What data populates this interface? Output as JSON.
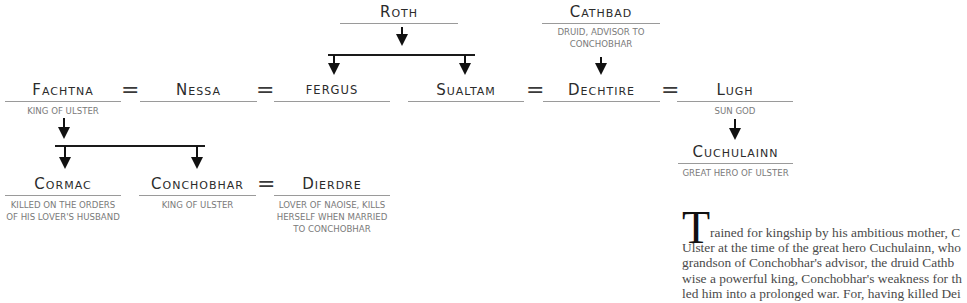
{
  "family_tree": {
    "roth": {
      "name": "Roth",
      "subtitle": ""
    },
    "cathbad": {
      "name": "Cathbad",
      "subtitle_lines": [
        "Druid, advisor to",
        "Conchobhar"
      ]
    },
    "fachtna": {
      "name": "Fachtna",
      "subtitle_lines": [
        "King of Ulster"
      ]
    },
    "nessa": {
      "name": "Nessa"
    },
    "fergus": {
      "name": "fergus"
    },
    "sualtam": {
      "name": "Sualtam"
    },
    "dechtire": {
      "name": "Dechtire"
    },
    "lugh": {
      "name": "Lugh",
      "subtitle_lines": [
        "Sun god"
      ]
    },
    "cuchulainn": {
      "name": "Cuchulainn",
      "subtitle_lines": [
        "Great hero of Ulster"
      ]
    },
    "cormac": {
      "name": "Cormac",
      "subtitle_lines": [
        "Killed on the orders",
        "of his lover's husband"
      ]
    },
    "conchobhar": {
      "name": "Conchobhar",
      "subtitle_lines": [
        "King of Ulster"
      ]
    },
    "dierdre": {
      "name": "Dierdre",
      "subtitle_lines": [
        "Lover of Naoise, kills",
        "herself when married",
        "to Conchobhar"
      ]
    },
    "marriage_symbol": "="
  },
  "article": {
    "drop_cap": "T",
    "lines": [
      "rained for kingship by his ambitious mother, C",
      "Ulster at the time of the great hero Cuchulainn, who",
      "grandson of Conchobhar's advisor, the druid Cathb",
      "wise a powerful king, Conchobhar's weakness for th",
      "led him into a prolonged war. For, having killed Dei"
    ]
  }
}
